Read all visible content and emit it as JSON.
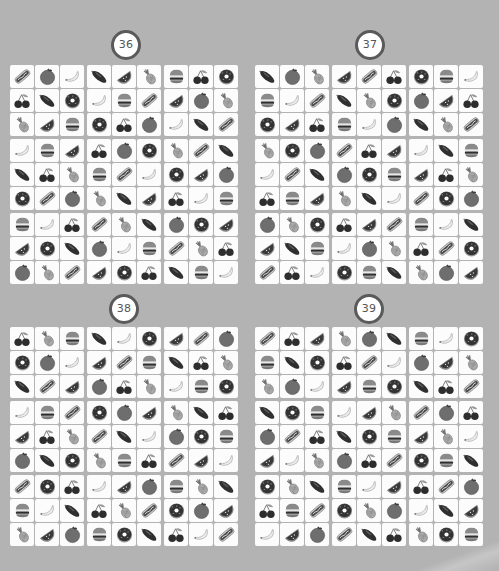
{
  "page": {
    "background": "#b3b3b3",
    "badge_ring_color": "#5a5a5a"
  },
  "icons": {
    "hotdog": "hotdog-icon",
    "orange": "orange-icon",
    "banana": "banana-icon",
    "eggplant": "eggplant-icon",
    "watermelon": "watermelon-icon",
    "pineapple": "pineapple-icon",
    "burger": "burger-icon",
    "cherries": "cherries-icon",
    "donut": "donut-icon"
  },
  "puzzles": [
    {
      "number": "36",
      "rows": [
        [
          "hotdog",
          "orange",
          "banana",
          "eggplant",
          "watermelon",
          "pineapple",
          "burger",
          "cherries",
          "donut"
        ],
        [
          "cherries",
          "eggplant",
          "donut",
          "banana",
          "burger",
          "hotdog",
          "watermelon",
          "orange",
          "pineapple"
        ],
        [
          "pineapple",
          "watermelon",
          "burger",
          "donut",
          "cherries",
          "orange",
          "banana",
          "eggplant",
          "hotdog"
        ],
        [
          "banana",
          "burger",
          "watermelon",
          "cherries",
          "orange",
          "donut",
          "pineapple",
          "hotdog",
          "eggplant"
        ],
        [
          "eggplant",
          "cherries",
          "pineapple",
          "burger",
          "hotdog",
          "banana",
          "donut",
          "watermelon",
          "orange"
        ],
        [
          "donut",
          "hotdog",
          "orange",
          "pineapple",
          "eggplant",
          "watermelon",
          "cherries",
          "banana",
          "burger"
        ],
        [
          "burger",
          "banana",
          "cherries",
          "hotdog",
          "pineapple",
          "eggplant",
          "orange",
          "donut",
          "watermelon"
        ],
        [
          "watermelon",
          "donut",
          "eggplant",
          "orange",
          "banana",
          "burger",
          "hotdog",
          "pineapple",
          "cherries"
        ],
        [
          "orange",
          "pineapple",
          "hotdog",
          "watermelon",
          "donut",
          "cherries",
          "eggplant",
          "burger",
          "banana"
        ]
      ]
    },
    {
      "number": "37",
      "rows": [
        [
          "eggplant",
          "orange",
          "pineapple",
          "watermelon",
          "hotdog",
          "cherries",
          "donut",
          "burger",
          "banana"
        ],
        [
          "burger",
          "banana",
          "hotdog",
          "eggplant",
          "pineapple",
          "donut",
          "orange",
          "watermelon",
          "cherries"
        ],
        [
          "donut",
          "watermelon",
          "cherries",
          "burger",
          "banana",
          "orange",
          "eggplant",
          "pineapple",
          "hotdog"
        ],
        [
          "pineapple",
          "donut",
          "orange",
          "hotdog",
          "cherries",
          "watermelon",
          "banana",
          "eggplant",
          "burger"
        ],
        [
          "banana",
          "hotdog",
          "eggplant",
          "orange",
          "donut",
          "burger",
          "watermelon",
          "cherries",
          "pineapple"
        ],
        [
          "cherries",
          "burger",
          "watermelon",
          "pineapple",
          "eggplant",
          "banana",
          "hotdog",
          "donut",
          "orange"
        ],
        [
          "orange",
          "pineapple",
          "donut",
          "cherries",
          "watermelon",
          "hotdog",
          "burger",
          "banana",
          "eggplant"
        ],
        [
          "watermelon",
          "eggplant",
          "burger",
          "banana",
          "orange",
          "pineapple",
          "cherries",
          "hotdog",
          "donut"
        ],
        [
          "hotdog",
          "cherries",
          "banana",
          "donut",
          "burger",
          "eggplant",
          "pineapple",
          "orange",
          "watermelon"
        ]
      ]
    },
    {
      "number": "38",
      "rows": [
        [
          "cherries",
          "pineapple",
          "burger",
          "eggplant",
          "banana",
          "donut",
          "watermelon",
          "hotdog",
          "orange"
        ],
        [
          "donut",
          "orange",
          "banana",
          "watermelon",
          "hotdog",
          "burger",
          "eggplant",
          "cherries",
          "pineapple"
        ],
        [
          "eggplant",
          "hotdog",
          "watermelon",
          "orange",
          "cherries",
          "pineapple",
          "banana",
          "burger",
          "donut"
        ],
        [
          "banana",
          "burger",
          "hotdog",
          "donut",
          "orange",
          "watermelon",
          "pineapple",
          "eggplant",
          "cherries"
        ],
        [
          "watermelon",
          "cherries",
          "pineapple",
          "hotdog",
          "eggplant",
          "banana",
          "orange",
          "donut",
          "burger"
        ],
        [
          "orange",
          "eggplant",
          "donut",
          "pineapple",
          "burger",
          "cherries",
          "hotdog",
          "watermelon",
          "banana"
        ],
        [
          "hotdog",
          "donut",
          "cherries",
          "banana",
          "watermelon",
          "orange",
          "burger",
          "pineapple",
          "eggplant"
        ],
        [
          "burger",
          "banana",
          "eggplant",
          "cherries",
          "pineapple",
          "hotdog",
          "donut",
          "orange",
          "watermelon"
        ],
        [
          "pineapple",
          "watermelon",
          "orange",
          "burger",
          "donut",
          "eggplant",
          "cherries",
          "banana",
          "hotdog"
        ]
      ]
    },
    {
      "number": "39",
      "rows": [
        [
          "hotdog",
          "cherries",
          "watermelon",
          "pineapple",
          "orange",
          "eggplant",
          "burger",
          "banana",
          "donut"
        ],
        [
          "burger",
          "eggplant",
          "donut",
          "cherries",
          "hotdog",
          "banana",
          "orange",
          "watermelon",
          "pineapple"
        ],
        [
          "pineapple",
          "orange",
          "banana",
          "watermelon",
          "burger",
          "donut",
          "eggplant",
          "cherries",
          "hotdog"
        ],
        [
          "eggplant",
          "donut",
          "burger",
          "banana",
          "watermelon",
          "pineapple",
          "hotdog",
          "orange",
          "cherries"
        ],
        [
          "orange",
          "hotdog",
          "cherries",
          "eggplant",
          "donut",
          "burger",
          "watermelon",
          "pineapple",
          "banana"
        ],
        [
          "watermelon",
          "banana",
          "pineapple",
          "orange",
          "cherries",
          "hotdog",
          "donut",
          "burger",
          "eggplant"
        ],
        [
          "donut",
          "pineapple",
          "eggplant",
          "burger",
          "banana",
          "watermelon",
          "cherries",
          "hotdog",
          "orange"
        ],
        [
          "cherries",
          "burger",
          "hotdog",
          "donut",
          "pineapple",
          "orange",
          "banana",
          "eggplant",
          "watermelon"
        ],
        [
          "banana",
          "watermelon",
          "orange",
          "hotdog",
          "eggplant",
          "cherries",
          "pineapple",
          "donut",
          "burger"
        ]
      ]
    }
  ]
}
